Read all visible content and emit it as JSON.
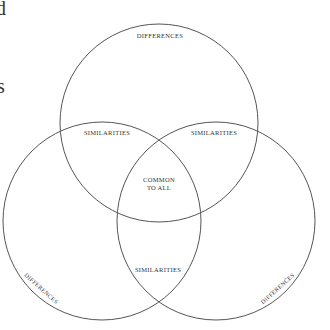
{
  "diagram": {
    "type": "venn-3",
    "stroke_color": "#555555",
    "text_color": "#333333",
    "background": "#ffffff",
    "circles": [
      {
        "name": "top",
        "cx": 159,
        "cy": 123,
        "r": 99
      },
      {
        "name": "left",
        "cx": 102,
        "cy": 221,
        "r": 99
      },
      {
        "name": "right",
        "cx": 216,
        "cy": 221,
        "r": 99
      }
    ],
    "labels": {
      "top_differences": "DIFFERENCES",
      "left_differences": "DIFFERENCES",
      "right_differences": "DIFFERENCES",
      "similarities_top_left": "SIMILARITIES",
      "similarities_top_right": "SIMILARITIES",
      "similarities_bottom": "SIMILARITIES",
      "common_line1": "COMMON",
      "common_line2": "TO ALL"
    }
  },
  "clipped_text": {
    "fragment_top": "d",
    "fragment_middle": "s"
  }
}
